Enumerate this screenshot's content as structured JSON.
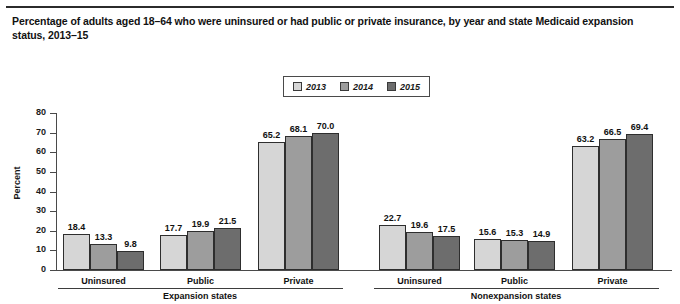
{
  "chart_data": {
    "type": "bar",
    "title": "Percentage of adults aged 18–64 who were uninsured or had public or private insurance, by year and state Medicaid expansion status, 2013–15",
    "xlabel": "",
    "ylabel": "Percent",
    "ylim": [
      0,
      80
    ],
    "yticks": [
      "0",
      "10",
      "20",
      "30",
      "40",
      "50",
      "60",
      "70",
      "80"
    ],
    "grid": false,
    "legend_position": "top-center",
    "legend": [
      "2013",
      "2014",
      "2015"
    ],
    "series_colors": [
      "#d6d6d6",
      "#9d9d9d",
      "#6d6d6d"
    ],
    "panels": [
      {
        "name": "Expansion states",
        "categories": [
          "Uninsured",
          "Public",
          "Private"
        ],
        "series": [
          {
            "name": "2013",
            "values": [
              18.4,
              17.7,
              65.2
            ]
          },
          {
            "name": "2014",
            "values": [
              13.3,
              19.9,
              68.1
            ]
          },
          {
            "name": "2015",
            "values": [
              9.8,
              21.5,
              70.0
            ]
          }
        ],
        "value_labels": [
          [
            "18.4",
            "13.3",
            "9.8"
          ],
          [
            "17.7",
            "19.9",
            "21.5"
          ],
          [
            "65.2",
            "68.1",
            "70.0"
          ]
        ]
      },
      {
        "name": "Nonexpansion states",
        "categories": [
          "Uninsured",
          "Public",
          "Private"
        ],
        "series": [
          {
            "name": "2013",
            "values": [
              22.7,
              15.6,
              63.2
            ]
          },
          {
            "name": "2014",
            "values": [
              19.6,
              15.3,
              66.5
            ]
          },
          {
            "name": "2015",
            "values": [
              17.5,
              14.9,
              69.4
            ]
          }
        ],
        "value_labels": [
          [
            "22.7",
            "19.6",
            "17.5"
          ],
          [
            "15.6",
            "15.3",
            "14.9"
          ],
          [
            "63.2",
            "66.5",
            "69.4"
          ]
        ]
      }
    ]
  }
}
